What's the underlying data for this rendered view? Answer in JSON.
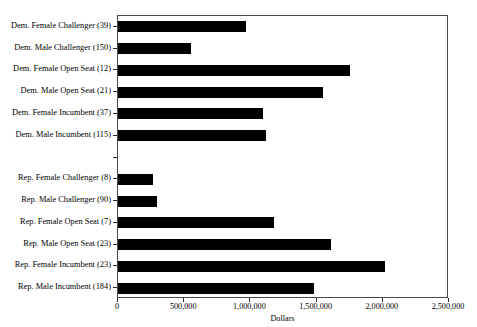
{
  "chart_data": {
    "type": "bar",
    "orientation": "horizontal",
    "title": "",
    "xlabel": "Dollars",
    "ylabel": "",
    "xlim": [
      0,
      2500000
    ],
    "xticks": [
      0,
      500000,
      1000000,
      1500000,
      2000000,
      2500000
    ],
    "xtick_labels": [
      "0",
      "500,000",
      "1,000,000",
      "1,500,000",
      "2,000,000",
      "2,500,000"
    ],
    "grid": false,
    "legend": null,
    "bar_color": "#000000",
    "categories": [
      "Dem. Female Challenger (39)",
      "Dem. Male Challenger (150)",
      "Dem. Female Open Seat (12)",
      "Dem. Male Open Seat (21)",
      "Dem. Female Incumbent (37)",
      "Dem. Male Incumbent (115)",
      "",
      "Rep. Female Challenger (8)",
      "Rep. Male Challenger (90)",
      "Rep. Female Open Seat (7)",
      "Rep. Male Open Seat (23)",
      "Rep. Female Incumbent (23)",
      "Rep. Male Incumbent (184)"
    ],
    "values": [
      970000,
      550000,
      1750000,
      1545000,
      1095000,
      1115000,
      null,
      265000,
      295000,
      1180000,
      1605000,
      2020000,
      1480000
    ],
    "group_gap_index": 6
  }
}
